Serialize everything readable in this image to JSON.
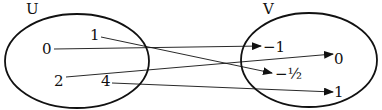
{
  "diagram": {
    "type": "function-mapping",
    "domain_set": {
      "label": "U",
      "elements": [
        "0",
        "1",
        "2",
        "4"
      ]
    },
    "codomain_set": {
      "label": "V",
      "elements": [
        "−1",
        "0",
        "−½",
        "1"
      ]
    },
    "mappings": [
      {
        "from": "0",
        "to": "−1"
      },
      {
        "from": "1",
        "to": "−½"
      },
      {
        "from": "2",
        "to": "0"
      },
      {
        "from": "4",
        "to": "1"
      }
    ],
    "colors": {
      "stroke": "#111111",
      "background": "#ffffff"
    }
  }
}
